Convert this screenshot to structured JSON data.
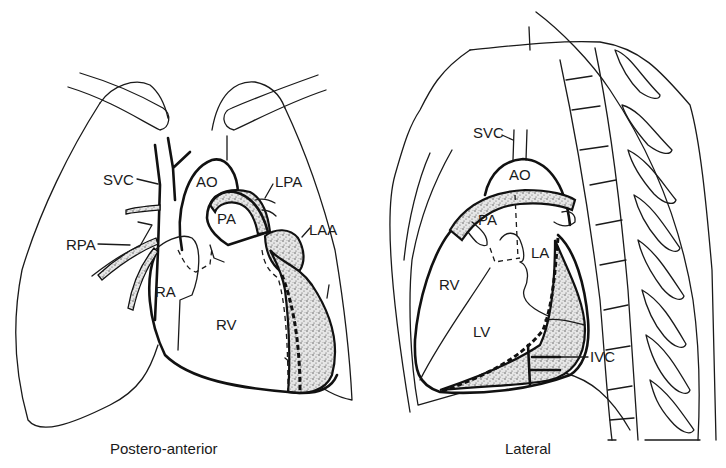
{
  "figure": {
    "panels": [
      {
        "id": "postero-anterior",
        "caption": "Postero-anterior",
        "labels": {
          "svc": "SVC",
          "ao": "AO",
          "lpa": "LPA",
          "pa": "PA",
          "laa": "LAA",
          "rpa": "RPA",
          "ra": "RA",
          "rv": "RV"
        }
      },
      {
        "id": "lateral",
        "caption": "Lateral",
        "labels": {
          "svc": "SVC",
          "ao": "AO",
          "pa": "PA",
          "la": "LA",
          "rv": "RV",
          "lv": "LV",
          "ivc": "IVC"
        }
      }
    ],
    "colors": {
      "line": "#1a1a1a",
      "background": "#ffffff",
      "stipple": "#555555"
    }
  }
}
